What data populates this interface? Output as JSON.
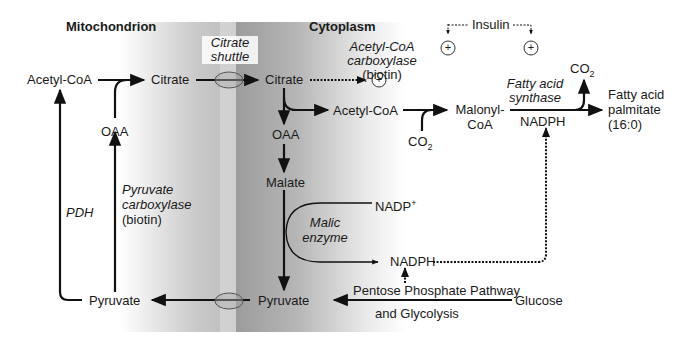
{
  "regions": {
    "mitochondrion": "Mitochondrion",
    "cytoplasm": "Cytoplasm"
  },
  "transport": {
    "citrate_shuttle_line1": "Citrate",
    "citrate_shuttle_line2": "shuttle"
  },
  "metabolites": {
    "acetyl_coa_mito": "Acetyl-CoA",
    "citrate_mito": "Citrate",
    "oaa_mito": "OAA",
    "pyruvate_mito": "Pyruvate",
    "citrate_cyto": "Citrate",
    "acetyl_coa_cyto": "Acetyl-CoA",
    "oaa_cyto": "OAA",
    "malate": "Malate",
    "pyruvate_cyto": "Pyruvate",
    "malonyl_coa_line1": "Malonyl-",
    "malonyl_coa_line2": "CoA",
    "co2_in": "CO",
    "co2_out": "CO",
    "co2_subscript": "2",
    "nadp_plus": "NADP",
    "nadp_plus_sup": "+",
    "nadph_malic": "NADPH",
    "nadph_fas": "NADPH",
    "fatty_acid_line1": "Fatty acid",
    "fatty_acid_line2": "palmitate",
    "fatty_acid_line3": "(16:0)",
    "glucose": "Glucose"
  },
  "enzymes": {
    "pdh": "PDH",
    "pyruvate_carboxylase_line1": "Pyruvate",
    "pyruvate_carboxylase_line2": "carboxylase",
    "pyruvate_carboxylase_line3": "(biotin)",
    "acc_line1": "Acetyl-CoA",
    "acc_line2": "carboxylase",
    "acc_line3": "(biotin)",
    "fas_line1": "Fatty acid",
    "fas_line2": "synthase",
    "malic_line1": "Malic",
    "malic_line2": "enzyme"
  },
  "pathways": {
    "ppp_line1": "Pentose Phosphate Pathway",
    "ppp_line2": "and Glycolysis"
  },
  "regulators": {
    "insulin": "Insulin",
    "activator_symbol": "+"
  }
}
